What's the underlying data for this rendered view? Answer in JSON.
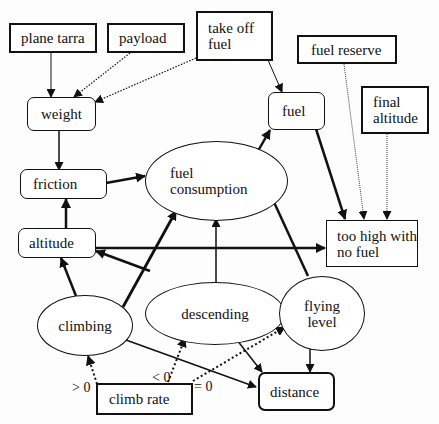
{
  "diagram": {
    "type": "causal influence diagram",
    "nodes": {
      "plane_tarra": {
        "label": "plane tarra",
        "shape": "box"
      },
      "payload": {
        "label": "payload",
        "shape": "box"
      },
      "take_off_fuel": {
        "label": "take off\nfuel",
        "shape": "box"
      },
      "fuel_reserve": {
        "label": "fuel reserve",
        "shape": "box"
      },
      "final_altitude": {
        "label": "final\naltitude",
        "shape": "box"
      },
      "weight": {
        "label": "weight",
        "shape": "rounded"
      },
      "fuel": {
        "label": "fuel",
        "shape": "rounded"
      },
      "friction": {
        "label": "friction",
        "shape": "rounded"
      },
      "fuel_consumption": {
        "label": "fuel\nconsumption",
        "shape": "ellipse"
      },
      "altitude": {
        "label": "altitude",
        "shape": "rounded"
      },
      "too_high": {
        "label": "too high with\nno fuel",
        "shape": "box"
      },
      "descending": {
        "label": "descending",
        "shape": "ellipse"
      },
      "flying_level": {
        "label": "flying\nlevel",
        "shape": "ellipse"
      },
      "climbing": {
        "label": "climbing",
        "shape": "ellipse"
      },
      "climb_rate": {
        "label": "climb rate",
        "shape": "box"
      },
      "distance": {
        "label": "distance",
        "shape": "rounded"
      }
    },
    "edge_labels": {
      "gt0": "> 0",
      "lt0": "< 0",
      "eq0": "= 0"
    },
    "edges": [
      {
        "from": "plane_tarra",
        "to": "weight",
        "style": "thin"
      },
      {
        "from": "payload",
        "to": "weight",
        "style": "dotted"
      },
      {
        "from": "take_off_fuel",
        "to": "weight",
        "style": "dotted"
      },
      {
        "from": "take_off_fuel",
        "to": "fuel",
        "style": "thin"
      },
      {
        "from": "weight",
        "to": "friction",
        "style": "medium"
      },
      {
        "from": "friction",
        "to": "fuel_consumption",
        "style": "thick"
      },
      {
        "from": "altitude",
        "to": "friction",
        "style": "thick"
      },
      {
        "from": "fuel_consumption",
        "to": "fuel",
        "style": "thick"
      },
      {
        "from": "fuel",
        "to": "too_high",
        "style": "thick"
      },
      {
        "from": "fuel_reserve",
        "to": "too_high",
        "style": "dotted"
      },
      {
        "from": "final_altitude",
        "to": "too_high",
        "style": "dotted"
      },
      {
        "from": "altitude",
        "to": "too_high",
        "style": "thick"
      },
      {
        "from": "climbing",
        "to": "altitude",
        "style": "thick"
      },
      {
        "from": "climbing",
        "to": "fuel_consumption",
        "style": "thick"
      },
      {
        "from": "climbing",
        "to": "distance",
        "style": "medium"
      },
      {
        "from": "descending",
        "to": "altitude",
        "style": "thick"
      },
      {
        "from": "descending",
        "to": "fuel_consumption",
        "style": "medium"
      },
      {
        "from": "descending",
        "to": "distance",
        "style": "medium"
      },
      {
        "from": "flying_level",
        "to": "fuel_consumption",
        "style": "thick"
      },
      {
        "from": "flying_level",
        "to": "distance",
        "style": "medium"
      },
      {
        "from": "climb_rate",
        "to": "climbing",
        "style": "dotted",
        "label": "> 0"
      },
      {
        "from": "climb_rate",
        "to": "descending",
        "style": "dotted",
        "label": "< 0"
      },
      {
        "from": "climb_rate",
        "to": "flying_level",
        "style": "dotted",
        "label": "= 0"
      }
    ]
  }
}
